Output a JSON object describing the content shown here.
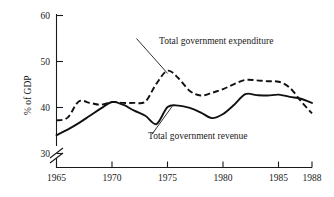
{
  "chart_data": {
    "type": "line",
    "title": "",
    "subtitle": "",
    "xlabel": "",
    "ylabel": "% of GDP",
    "xlim": [
      1965,
      1988
    ],
    "ylim": [
      30,
      60
    ],
    "yaxis_break": true,
    "yaxis_break_note": "axis broken below 30",
    "grid": false,
    "legend_position": "inline-annotations",
    "xticks": [
      1965,
      1970,
      1975,
      1980,
      1985,
      1988
    ],
    "xtick_labels": [
      "1965",
      "1970",
      "1975",
      "1980",
      "1985",
      "1988"
    ],
    "yticks": [
      30,
      40,
      50,
      60
    ],
    "ytick_labels": [
      "30",
      "40",
      "50",
      "60"
    ],
    "x": [
      1965,
      1966,
      1967,
      1968,
      1969,
      1970,
      1971,
      1972,
      1973,
      1974,
      1975,
      1976,
      1977,
      1978,
      1979,
      1980,
      1981,
      1982,
      1983,
      1984,
      1985,
      1986,
      1987,
      1988
    ],
    "series": [
      {
        "name": "Total government expenditure",
        "style": "dashed",
        "color": "#111111",
        "values": [
          37.2,
          37.8,
          41.3,
          41.0,
          40.6,
          41.2,
          41.0,
          41.0,
          41.3,
          45.2,
          48.0,
          46.3,
          43.6,
          42.6,
          43.2,
          44.0,
          45.1,
          46.0,
          45.9,
          45.7,
          45.6,
          44.3,
          41.4,
          38.7
        ]
      },
      {
        "name": "Total government revenue",
        "style": "solid",
        "color": "#111111",
        "values": [
          34.0,
          35.2,
          36.6,
          38.2,
          39.8,
          41.2,
          40.6,
          39.3,
          38.2,
          36.4,
          40.1,
          40.4,
          39.9,
          38.9,
          37.7,
          38.6,
          40.6,
          42.9,
          42.7,
          42.6,
          42.8,
          42.3,
          41.9,
          41.0
        ]
      }
    ],
    "annotations": [
      {
        "text": "Total government expenditure",
        "anchor_x": 1975.0,
        "anchor_y": 47.4,
        "label_x": 1972.2,
        "label_y": 55.0,
        "leader_line": true
      },
      {
        "text": "Total government revenue",
        "anchor_x": 1975.4,
        "anchor_y": 40.2,
        "label_x": 1973.6,
        "label_y": 34.2,
        "leader_line": true
      }
    ]
  },
  "axes": {
    "y_axis_title": "% of GDP"
  }
}
